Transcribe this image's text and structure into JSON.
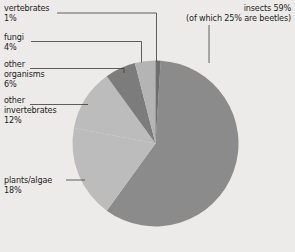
{
  "background_color": "#ecebe9",
  "chart_data": {
    "type": "pie",
    "title": "",
    "subtitle": "",
    "xlabel": "",
    "ylabel": "",
    "legend_position": "callout-labels",
    "grid": false,
    "total": 100,
    "units": "percent",
    "categories": [
      "insects",
      "plants/algae",
      "other invertebrates",
      "other organisms",
      "fungi",
      "vertebrates"
    ],
    "values": [
      59,
      18,
      12,
      6,
      4,
      1
    ],
    "slices": [
      {
        "name": "insects",
        "label_line1": "insects 59%",
        "label_line2": "(of which 25% are beetles)",
        "value": 59,
        "value_text": "59%",
        "note": "of which 25% are beetles",
        "color": "#8b8b8b",
        "start_angle": 3.6,
        "end_angle": 216.0
      },
      {
        "name": "plants/algae",
        "label_line1": "plants/algae",
        "label_line2": "18%",
        "value": 18,
        "value_text": "18%",
        "color": "#bcbcbc",
        "start_angle": 216.0,
        "end_angle": 280.8
      },
      {
        "name": "other invertebrates",
        "label_line1": "other",
        "label_line2": "invertebrates",
        "label_line3": "12%",
        "value": 12,
        "value_text": "12%",
        "color": "#bcbcbc",
        "start_angle": 280.8,
        "end_angle": 324.0
      },
      {
        "name": "other organisms",
        "label_line1": "other",
        "label_line2": "organisms",
        "label_line3": "6%",
        "value": 6,
        "value_text": "6%",
        "color": "#7c7c7c",
        "start_angle": 324.0,
        "end_angle": 345.6
      },
      {
        "name": "fungi",
        "label_line1": "fungi",
        "label_line2": "4%",
        "value": 4,
        "value_text": "4%",
        "color": "#b4b4b4",
        "start_angle": 345.6,
        "end_angle": 360.0
      },
      {
        "name": "vertebrates",
        "label_line1": "vertebrates",
        "label_line2": "1%",
        "value": 1,
        "value_text": "1%",
        "color": "#6e6e6e",
        "start_angle": 0.0,
        "end_angle": 3.6
      }
    ]
  },
  "labels": {
    "vertebrates_name": "vertebrates",
    "vertebrates_pct": "1%",
    "fungi_name": "fungi",
    "fungi_pct": "4%",
    "other_organisms_l1": "other",
    "other_organisms_l2": "organisms",
    "other_organisms_pct": "6%",
    "other_invertebrates_l1": "other",
    "other_invertebrates_l2": "invertebrates",
    "other_invertebrates_pct": "12%",
    "plants_algae_name": "plants/algae",
    "plants_algae_pct": "18%",
    "insects_l1": "insects 59%",
    "insects_l2": "(of which 25% are beetles)"
  }
}
